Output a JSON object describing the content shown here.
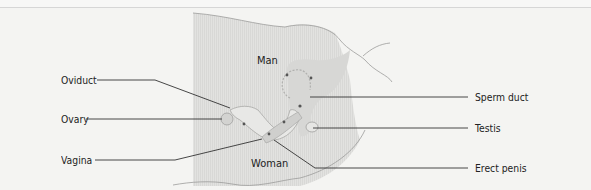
{
  "diagram": {
    "type": "anatomical-illustration",
    "region_labels": {
      "man": "Man",
      "woman": "Woman"
    },
    "left_labels": [
      {
        "id": "oviduct",
        "text": "Oviduct"
      },
      {
        "id": "ovary",
        "text": "Ovary"
      },
      {
        "id": "vagina",
        "text": "Vagina"
      }
    ],
    "right_labels": [
      {
        "id": "sperm-duct",
        "text": "Sperm duct"
      },
      {
        "id": "testis",
        "text": "Testis"
      },
      {
        "id": "erect-penis",
        "text": "Erect penis"
      }
    ],
    "colors": {
      "background": "#f4f4f2",
      "body_fill": "#e3e3e1",
      "organ_fill": "#d3d3d1",
      "line": "#333333",
      "outline": "#9a9a98"
    }
  }
}
